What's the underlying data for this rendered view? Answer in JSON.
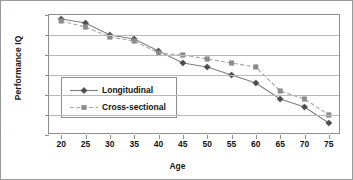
{
  "chart_data": {
    "type": "line",
    "title": "",
    "xlabel": "Age",
    "ylabel": "Performance IQ",
    "x": [
      20,
      25,
      30,
      35,
      40,
      45,
      50,
      55,
      60,
      65,
      70,
      75
    ],
    "xtick_labels": [
      "20",
      "25",
      "30",
      "35",
      "40",
      "45",
      "50",
      "55",
      "60",
      "65",
      "70",
      "75"
    ],
    "ytick_labels": [
      "105",
      "100",
      "95",
      "90",
      "85",
      "80",
      "75"
    ],
    "xlim": [
      17.5,
      77.5
    ],
    "ylim": [
      75,
      105
    ],
    "grid": "horizontal",
    "legend_position": "inside-lower-left",
    "series": [
      {
        "name": "Longitudinal",
        "marker": "diamond",
        "line_style": "solid",
        "color": "#808080",
        "marker_color": "#4d4d4d",
        "values": [
          104,
          103,
          100,
          99,
          96,
          93,
          92,
          90,
          88,
          84,
          82,
          78
        ]
      },
      {
        "name": "Cross-sectional",
        "marker": "square",
        "line_style": "dashed",
        "color": "#a6a6a6",
        "marker_color": "#8c8c8c",
        "values": [
          103.5,
          102,
          99.5,
          98.5,
          95.5,
          95,
          94,
          93,
          92,
          86,
          84,
          80
        ]
      }
    ]
  }
}
